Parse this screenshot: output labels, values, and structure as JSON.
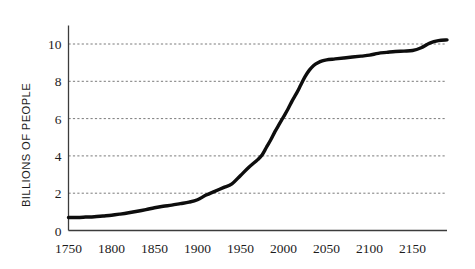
{
  "chart_data": {
    "type": "line",
    "title": "",
    "subtitle": "",
    "xlabel": "",
    "ylabel": "BILLIONS OF PEOPLE",
    "xlim": [
      1750,
      2190
    ],
    "ylim": [
      0,
      11.2
    ],
    "xticks": [
      1750,
      1800,
      1850,
      1900,
      1950,
      2000,
      2050,
      2100,
      2150
    ],
    "xtick_labels": [
      "1750",
      "1800",
      "1850",
      "1900",
      "1950",
      "2000",
      "2050",
      "2100",
      "2150"
    ],
    "yticks": [
      0,
      2,
      4,
      6,
      8,
      10
    ],
    "ytick_labels": [
      "0",
      "2",
      "4",
      "6",
      "8",
      "10"
    ],
    "grid": {
      "horizontal": true,
      "vertical": false,
      "style": "dotted",
      "color": "#6b6b6b"
    },
    "legend": {
      "visible": false,
      "position": "none"
    },
    "annotations": [],
    "series": [
      {
        "name": "World population",
        "color": "#0d0d0d",
        "linewidth": 3.4,
        "x": [
          1750,
          1760,
          1770,
          1780,
          1790,
          1800,
          1810,
          1820,
          1830,
          1840,
          1850,
          1860,
          1870,
          1880,
          1890,
          1900,
          1910,
          1920,
          1930,
          1940,
          1950,
          1960,
          1970,
          1975,
          1980,
          1985,
          1990,
          1995,
          2000,
          2005,
          2010,
          2015,
          2020,
          2025,
          2030,
          2035,
          2040,
          2045,
          2050,
          2060,
          2070,
          2080,
          2090,
          2100,
          2110,
          2120,
          2130,
          2140,
          2150,
          2160,
          2170,
          2180,
          2190
        ],
        "y": [
          0.7,
          0.7,
          0.72,
          0.74,
          0.78,
          0.82,
          0.88,
          0.95,
          1.03,
          1.12,
          1.22,
          1.3,
          1.36,
          1.44,
          1.52,
          1.65,
          1.9,
          2.1,
          2.3,
          2.5,
          2.95,
          3.4,
          3.8,
          4.05,
          4.45,
          4.85,
          5.3,
          5.7,
          6.1,
          6.5,
          6.95,
          7.35,
          7.8,
          8.25,
          8.6,
          8.85,
          9.0,
          9.1,
          9.15,
          9.2,
          9.25,
          9.3,
          9.35,
          9.4,
          9.5,
          9.55,
          9.6,
          9.62,
          9.65,
          9.8,
          10.05,
          10.18,
          10.22
        ]
      }
    ]
  },
  "axis_title": {
    "y": "BILLIONS OF PEOPLE"
  }
}
